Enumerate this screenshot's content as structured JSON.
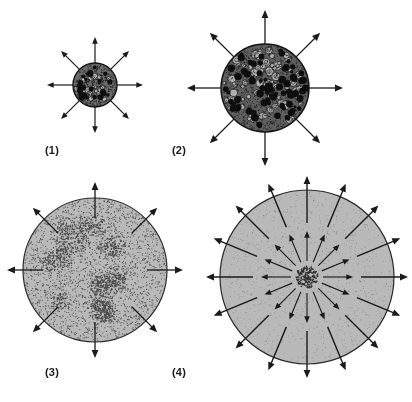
{
  "figure": {
    "width": 412,
    "height": 402,
    "background_color": "#ffffff",
    "stroke_color": "#1a1a1a",
    "caption_font_size": 11
  },
  "panels": [
    {
      "id": "panel-1",
      "label": "(1)",
      "label_x": 45,
      "label_y": 144,
      "description": "small dense granular sphere with eight outward arrows",
      "circle": {
        "cx": 95,
        "cy": 85,
        "r": 22,
        "fill_color": "#6b6b6b",
        "edge_color": "#141414",
        "texture": "coarse-granules"
      },
      "texture": {
        "kind": "mixed-blobs",
        "dark_blob_color": "#0d0d0d",
        "ring_blob_color": "#b8b8b8",
        "dark_blob_count": 26,
        "ring_blob_count": 22,
        "blob_min_r": 1.6,
        "blob_max_r": 3.6
      },
      "arrows": {
        "rings": [
          {
            "count": 8,
            "start_radius": 22,
            "end_radius": 48,
            "angle_offset_deg": 0,
            "head_size": 5,
            "line_width": 1.2
          }
        ]
      }
    },
    {
      "id": "panel-2",
      "label": "(2)",
      "label_x": 172,
      "label_y": 144,
      "description": "larger dense granular sphere with eight outward arrows",
      "circle": {
        "cx": 265,
        "cy": 88,
        "r": 44,
        "fill_color": "#5f5f5f",
        "edge_color": "#141414",
        "texture": "coarse-granules"
      },
      "texture": {
        "kind": "mixed-blobs",
        "dark_blob_color": "#0d0d0d",
        "ring_blob_color": "#b0b0b0",
        "dark_blob_count": 78,
        "ring_blob_count": 86,
        "blob_min_r": 1.6,
        "blob_max_r": 4.4
      },
      "arrows": {
        "rings": [
          {
            "count": 8,
            "start_radius": 44,
            "end_radius": 78,
            "angle_offset_deg": 0,
            "head_size": 6,
            "line_width": 1.3
          }
        ]
      }
    },
    {
      "id": "panel-3",
      "label": "(3)",
      "label_x": 45,
      "label_y": 366,
      "description": "large pale sphere with stippled clumps and eight arrows crossing the rim",
      "circle": {
        "cx": 95,
        "cy": 270,
        "r": 72,
        "fill_color": "#b9b9b9",
        "edge_color": "#2a2a2a",
        "texture": "fine-stipple-clusters"
      },
      "texture": {
        "kind": "stipple-clusters",
        "dot_color": "#4a4a4a",
        "background_dot_count": 2100,
        "cluster_count": 18,
        "cluster_dot_count": 70,
        "cluster_radius": 11,
        "dot_radius": 0.55
      },
      "arrows": {
        "rings": [
          {
            "count": 8,
            "start_radius": 52,
            "end_radius": 88,
            "angle_offset_deg": 0,
            "head_size": 6,
            "line_width": 1.3
          }
        ]
      }
    },
    {
      "id": "panel-4",
      "label": "(4)",
      "label_x": 172,
      "label_y": 366,
      "description": "largest pale sphere with small dark core and two rings of radiating arrows",
      "circle": {
        "cx": 307,
        "cy": 277,
        "r": 87,
        "fill_color": "#b9b9b9",
        "edge_color": "#2a2a2a",
        "texture": "smooth-pale"
      },
      "texture": {
        "kind": "core-cluster",
        "dot_color": "#2e2e2e",
        "background_dot_count": 900,
        "core_radius": 11,
        "core_dot_count": 150,
        "dot_radius": 0.5
      },
      "arrows": {
        "rings": [
          {
            "count": 16,
            "start_radius": 16,
            "end_radius": 46,
            "angle_offset_deg": 0,
            "head_size": 5,
            "line_width": 1.1
          },
          {
            "count": 16,
            "start_radius": 54,
            "end_radius": 101,
            "angle_offset_deg": 0,
            "head_size": 6,
            "line_width": 1.4
          }
        ]
      }
    }
  ]
}
